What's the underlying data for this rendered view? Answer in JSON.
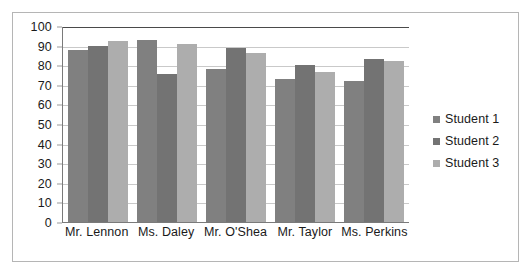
{
  "chart_data": {
    "type": "bar",
    "title": "",
    "subtitle": "",
    "xlabel": "",
    "ylabel": "",
    "ylim": [
      0,
      100
    ],
    "yticks": [
      0,
      10,
      20,
      30,
      40,
      50,
      60,
      70,
      80,
      90,
      100
    ],
    "grid": true,
    "grid_axis": "y",
    "legend_position": "right",
    "categories": [
      "Mr. Lennon",
      "Ms. Daley",
      "Mr. O'Shea",
      "Mr. Taylor",
      "Ms. Perkins"
    ],
    "series": [
      {
        "name": "Student 1",
        "color": "#808080",
        "values": [
          88,
          93,
          78,
          73,
          72
        ]
      },
      {
        "name": "Student 2",
        "color": "#737373",
        "values": [
          90,
          75.5,
          89,
          80,
          83
        ]
      },
      {
        "name": "Student 3",
        "color": "#adadad",
        "values": [
          92.5,
          91,
          86,
          76.5,
          82
        ]
      }
    ]
  },
  "colors": {
    "frame_border": "#b5b5b5",
    "axis_line": "#7a7a7a",
    "gridline": "#c9c9c9",
    "top_gridline": "#4a4a4a",
    "text": "#1a1a1a",
    "plot_background": "#ffffff"
  }
}
